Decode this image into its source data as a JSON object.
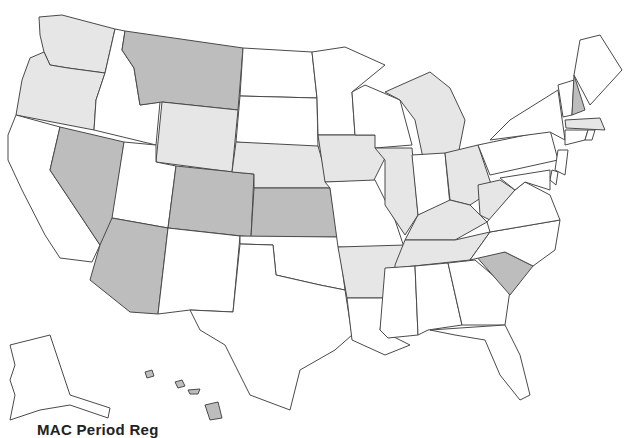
{
  "map": {
    "title": "MAC Period Reg",
    "legend_tiers": [
      {
        "tier": 0,
        "color": "#ffffff"
      },
      {
        "tier": 1,
        "color": "#e6e6e6"
      },
      {
        "tier": 2,
        "color": "#bdbdbd"
      }
    ],
    "states": {
      "WA": 1,
      "OR": 1,
      "CA": 0,
      "ID": 0,
      "NV": 2,
      "MT": 2,
      "WY": 1,
      "UT": 0,
      "AZ": 2,
      "CO": 2,
      "NM": 0,
      "ND": 0,
      "SD": 0,
      "NE": 1,
      "KS": 2,
      "OK": 0,
      "TX": 0,
      "MN": 0,
      "IA": 1,
      "MO": 0,
      "AR": 1,
      "LA": 0,
      "WI": 0,
      "IL": 1,
      "MI": 1,
      "IN": 0,
      "OH": 1,
      "KY": 1,
      "TN": 1,
      "MS": 0,
      "AL": 0,
      "GA": 0,
      "FL": 0,
      "SC": 2,
      "NC": 0,
      "VA": 0,
      "WV": 1,
      "PA": 0,
      "NY": 0,
      "VT": 0,
      "NH": 2,
      "ME": 0,
      "MA": 1,
      "CT": 0,
      "RI": 0,
      "NJ": 0,
      "DE": 0,
      "MD": 0,
      "AK": 0,
      "HI": 2
    }
  }
}
